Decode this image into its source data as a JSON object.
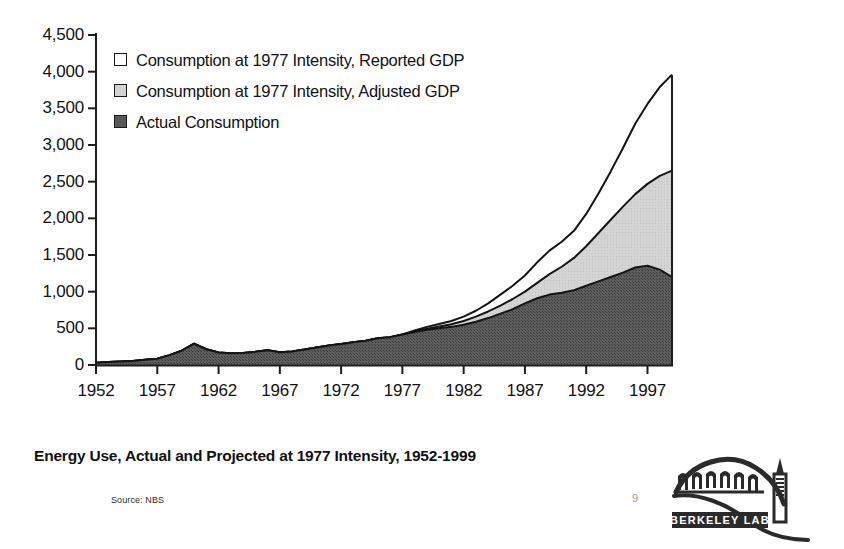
{
  "chart_data": {
    "type": "area",
    "stacked": false,
    "title": "Energy Use, Actual and Projected at 1977 Intensity, 1952-1999",
    "xlabel": "",
    "ylabel": "",
    "ylim": [
      0,
      4500
    ],
    "ytick_step": 500,
    "ytick_labels": [
      "0",
      "500",
      "1,000",
      "1,500",
      "2,000",
      "2,500",
      "3,000",
      "3,500",
      "4,000",
      "4,500"
    ],
    "xlim": [
      1952,
      1999
    ],
    "xtick_labels": [
      "1952",
      "1957",
      "1962",
      "1967",
      "1972",
      "1977",
      "1982",
      "1987",
      "1992",
      "1997"
    ],
    "xticks": [
      1952,
      1957,
      1962,
      1967,
      1972,
      1977,
      1982,
      1987,
      1992,
      1997
    ],
    "grid": false,
    "legend_position": "upper-left-inside",
    "x": [
      1952,
      1953,
      1954,
      1955,
      1956,
      1957,
      1958,
      1959,
      1960,
      1961,
      1962,
      1963,
      1964,
      1965,
      1966,
      1967,
      1968,
      1969,
      1970,
      1971,
      1972,
      1973,
      1974,
      1975,
      1976,
      1977,
      1978,
      1979,
      1980,
      1981,
      1982,
      1983,
      1984,
      1985,
      1986,
      1987,
      1988,
      1989,
      1990,
      1991,
      1992,
      1993,
      1994,
      1995,
      1996,
      1997,
      1998,
      1999
    ],
    "series": [
      {
        "name": "Consumption at 1977 Intensity, Reported GDP",
        "color": "#ffffff",
        "values": [
          30,
          40,
          48,
          55,
          70,
          85,
          135,
          195,
          290,
          215,
          170,
          160,
          165,
          180,
          200,
          175,
          185,
          210,
          240,
          265,
          285,
          310,
          330,
          365,
          380,
          415,
          470,
          520,
          560,
          600,
          660,
          740,
          840,
          960,
          1080,
          1220,
          1400,
          1560,
          1680,
          1830,
          2060,
          2340,
          2640,
          2960,
          3290,
          3560,
          3790,
          3960
        ]
      },
      {
        "name": "Consumption at 1977 Intensity, Adjusted GDP",
        "color": "#d2d2d2",
        "values": [
          30,
          40,
          48,
          55,
          70,
          85,
          135,
          195,
          290,
          215,
          170,
          160,
          165,
          180,
          200,
          175,
          185,
          210,
          240,
          265,
          285,
          310,
          330,
          365,
          380,
          415,
          455,
          495,
          525,
          555,
          600,
          660,
          730,
          810,
          900,
          1000,
          1120,
          1240,
          1340,
          1460,
          1620,
          1800,
          1980,
          2160,
          2330,
          2470,
          2580,
          2650
        ]
      },
      {
        "name": "Actual Consumption",
        "color": "#585858",
        "values": [
          30,
          40,
          48,
          55,
          70,
          85,
          135,
          195,
          290,
          215,
          170,
          160,
          165,
          180,
          200,
          175,
          185,
          210,
          240,
          265,
          285,
          310,
          330,
          365,
          380,
          415,
          450,
          480,
          500,
          520,
          550,
          590,
          640,
          700,
          760,
          840,
          910,
          960,
          985,
          1020,
          1080,
          1140,
          1200,
          1260,
          1330,
          1355,
          1300,
          1200
        ]
      }
    ]
  },
  "legend": {
    "items": [
      {
        "label": "Consumption at 1977 Intensity, Reported GDP",
        "color": "#ffffff"
      },
      {
        "label": "Consumption at 1977 Intensity, Adjusted GDP",
        "color": "#d2d2d2"
      },
      {
        "label": "Actual Consumption",
        "color": "#585858"
      }
    ]
  },
  "caption": {
    "title": "Energy Use, Actual and Projected at 1977 Intensity, 1952-1999",
    "source": "Source: NBS",
    "page_number": "9"
  },
  "logo": {
    "name": "berkeley-lab-logo",
    "banner_text": "BERKELEY LAB"
  }
}
